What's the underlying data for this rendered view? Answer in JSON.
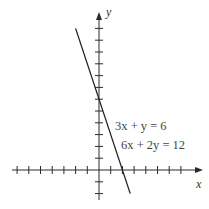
{
  "chart_data": {
    "type": "line",
    "title": "",
    "xlabel": "x",
    "ylabel": "y",
    "xlim": [
      -7.5,
      9
    ],
    "ylim": [
      -2.5,
      13.5
    ],
    "grid": false,
    "legend": null,
    "x_ticks": [
      -7,
      -6,
      -5,
      -4,
      -3,
      -2,
      -1,
      1,
      2,
      3,
      4,
      5,
      6,
      7
    ],
    "y_ticks": [
      -2,
      -1,
      1,
      2,
      3,
      4,
      5,
      6,
      7,
      8,
      9,
      10,
      11,
      12
    ],
    "tick_labels_shown": false,
    "series": [
      {
        "name": "3x + y = 6",
        "equivalent": "6x + 2y = 12",
        "slope": -3,
        "intercept": 6,
        "x": [
          -2.0,
          2.67
        ],
        "y": [
          12.0,
          -2.0
        ],
        "x_intercept": 2,
        "y_intercept": 6
      }
    ],
    "annotations": [
      {
        "text": "3x + y = 6",
        "x": 2.6,
        "y": 4.2
      },
      {
        "text": "6x + 2y = 12",
        "x": 3.2,
        "y": 2.5
      }
    ]
  },
  "layout": {
    "origin_px": [
      99,
      170
    ],
    "unit_px_x": 11.7,
    "unit_px_y": 11.8,
    "x_axis_px": [
      12,
      203
    ],
    "y_axis_px": [
      12,
      200
    ],
    "tick_half_len": 4
  },
  "labels": {
    "x_axis": "x",
    "y_axis": "y",
    "equation_1": "3x + y = 6",
    "equation_2": "6x + 2y = 12"
  },
  "colors": {
    "axis": "#2a2a2a",
    "line": "#222222",
    "text": "#444444",
    "background": "#ffffff"
  }
}
